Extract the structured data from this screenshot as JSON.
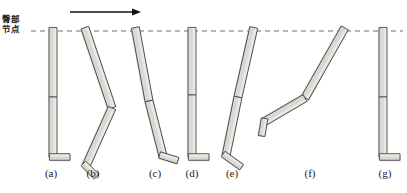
{
  "figure": {
    "background_color": "#ffffff",
    "width": 407,
    "height": 193,
    "annotations": {
      "hip_label_line1": "臀部",
      "hip_label_line2": "节点",
      "hip_label_name": "hip joint (buttock node)",
      "direction_arrow": {
        "name": "direction-of-travel-arrow",
        "x1": 70,
        "y1": 12,
        "x2": 141,
        "y2": 12,
        "color": "#111111"
      },
      "reference_line": {
        "name": "hip-height-reference-dashed-line",
        "y": 31,
        "x1": 31,
        "x2": 403,
        "color": "#6f6f6f",
        "dash": "5 4"
      }
    },
    "style": {
      "limb_fill": "#d9d9d4",
      "limb_fill_light": "#e9e9e5",
      "limb_stroke": "#4a4a4a",
      "shadow": "#c3c3bd",
      "caption_color": "#1b1b1b",
      "label_color": "#1b1b1b"
    },
    "captions": [
      {
        "label": "(a)",
        "x": 51
      },
      {
        "label": "(b)",
        "x": 93
      },
      {
        "label": "(c)",
        "x": 155
      },
      {
        "label": "(d)",
        "x": 192
      },
      {
        "label": "(e)",
        "x": 232
      },
      {
        "label": "(f)",
        "x": 310
      },
      {
        "label": "(g)",
        "x": 385
      }
    ]
  },
  "chart_data": {
    "type": "diagram",
    "units": "pixels",
    "reference_line_y": 31,
    "segments_per_leg": [
      "thigh",
      "shank",
      "foot"
    ],
    "poses": [
      {
        "id": "a",
        "caption": "(a)",
        "description": "Leg fully extended vertical, foot flat on ground, heel-strike / stance start",
        "hip": [
          53,
          31
        ],
        "knee": [
          53,
          97
        ],
        "ankle": [
          53,
          157
        ],
        "toe": [
          68,
          157
        ],
        "thigh_angle_deg": 90,
        "shank_angle_deg": 90,
        "foot_angle_deg": 0,
        "limb_width": 8
      },
      {
        "id": "b",
        "caption": "(b)",
        "description": "Thigh swung forward-down to the right, knee flexed, shank swept back-down to the left, foot pointing down-left",
        "hip": [
          86,
          31
        ],
        "knee": [
          112,
          108
        ],
        "ankle": [
          86,
          166
        ],
        "toe": [
          95,
          175
        ],
        "thigh_angle_deg": 71,
        "shank_angle_deg": 114,
        "foot_angle_deg": 45,
        "limb_width": 8
      },
      {
        "id": "c",
        "caption": "(c)",
        "description": "Leg nearly straight tilted forward, foot contacting ground ahead, heel strike",
        "hip": [
          136,
          31
        ],
        "knee": [
          149,
          101
        ],
        "ankle": [
          163,
          156
        ],
        "toe": [
          176,
          160
        ],
        "thigh_angle_deg": 79,
        "shank_angle_deg": 76,
        "foot_angle_deg": 17,
        "limb_width": 8
      },
      {
        "id": "d",
        "caption": "(d)",
        "description": "Leg fully extended vertical under hip, foot flat, mid-stance",
        "hip": [
          192,
          31
        ],
        "knee": [
          192,
          95
        ],
        "ankle": [
          192,
          157
        ],
        "toe": [
          207,
          157
        ],
        "thigh_angle_deg": 90,
        "shank_angle_deg": 90,
        "foot_angle_deg": 0,
        "limb_width": 8
      },
      {
        "id": "e",
        "caption": "(e)",
        "description": "Leg tilted backward, hip ahead of foot, foot at rear pointing down-left, toe-off",
        "hip": [
          253,
          31
        ],
        "knee": [
          238,
          97
        ],
        "ankle": [
          226,
          156
        ],
        "toe": [
          240,
          166
        ],
        "thigh_angle_deg": 103,
        "shank_angle_deg": 101,
        "foot_angle_deg": 35,
        "limb_width": 8
      },
      {
        "id": "f",
        "caption": "(f)",
        "description": "Swing phase: thigh trailing behind hip down-left, knee strongly flexed, shank swept far back-left, foot at far left pointing down",
        "hip": [
          343,
          31
        ],
        "knee": [
          305,
          98
        ],
        "ankle": [
          264,
          122
        ],
        "toe": [
          262,
          134
        ],
        "thigh_angle_deg": 119,
        "shank_angle_deg": 150,
        "foot_angle_deg": 80,
        "limb_width": 8
      },
      {
        "id": "g",
        "caption": "(g)",
        "description": "Leg returned to fully extended vertical, foot flat on ground, cycle complete",
        "hip": [
          383,
          31
        ],
        "knee": [
          383,
          97
        ],
        "ankle": [
          383,
          157
        ],
        "toe": [
          398,
          157
        ],
        "thigh_angle_deg": 90,
        "shank_angle_deg": 90,
        "foot_angle_deg": 0,
        "limb_width": 8
      }
    ]
  }
}
